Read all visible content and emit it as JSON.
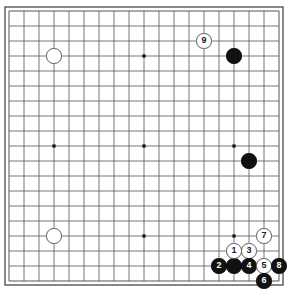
{
  "board": {
    "name": "go-board",
    "size": 19,
    "origin_x": 9,
    "origin_y": 11,
    "spacing": 15,
    "line_color": "#555555",
    "edge_color": "#3a3a3a",
    "board_color": "#ffffff",
    "star_point_color": "#111111",
    "star_points": [
      {
        "col": 3,
        "row": 3
      },
      {
        "col": 9,
        "row": 3
      },
      {
        "col": 15,
        "row": 3
      },
      {
        "col": 3,
        "row": 9
      },
      {
        "col": 9,
        "row": 9
      },
      {
        "col": 15,
        "row": 9
      },
      {
        "col": 3,
        "row": 15
      },
      {
        "col": 9,
        "row": 15
      },
      {
        "col": 15,
        "row": 15
      }
    ]
  },
  "stones": [
    {
      "id": "white-upper-left-hoshi",
      "color": "white",
      "col": 3,
      "row": 3,
      "label": ""
    },
    {
      "id": "white-lower-left-hoshi",
      "color": "white",
      "col": 3,
      "row": 15,
      "label": ""
    },
    {
      "id": "black-upper-right",
      "color": "black",
      "col": 15,
      "row": 3,
      "label": ""
    },
    {
      "id": "black-right-side",
      "color": "black",
      "col": 16,
      "row": 10,
      "label": ""
    },
    {
      "id": "black-bottom-right-corner",
      "color": "black",
      "col": 15,
      "row": 17,
      "label": ""
    },
    {
      "id": "move-9",
      "color": "white",
      "col": 13,
      "row": 2,
      "label": "9"
    },
    {
      "id": "move-7",
      "color": "white",
      "col": 17,
      "row": 15,
      "label": "7"
    },
    {
      "id": "move-1",
      "color": "white",
      "col": 15,
      "row": 16,
      "label": "1"
    },
    {
      "id": "move-3",
      "color": "white",
      "col": 16,
      "row": 16,
      "label": "3"
    },
    {
      "id": "move-2",
      "color": "black",
      "col": 14,
      "row": 17,
      "label": "2"
    },
    {
      "id": "move-4",
      "color": "black",
      "col": 16,
      "row": 17,
      "label": "4"
    },
    {
      "id": "move-5",
      "color": "white",
      "col": 17,
      "row": 17,
      "label": "5"
    },
    {
      "id": "move-8",
      "color": "black",
      "col": 18,
      "row": 17,
      "label": "8"
    },
    {
      "id": "move-6",
      "color": "black",
      "col": 17,
      "row": 18,
      "label": "6"
    }
  ],
  "legend": {
    "move_numbers": [
      "1",
      "2",
      "3",
      "4",
      "5",
      "6",
      "7",
      "8",
      "9"
    ]
  }
}
